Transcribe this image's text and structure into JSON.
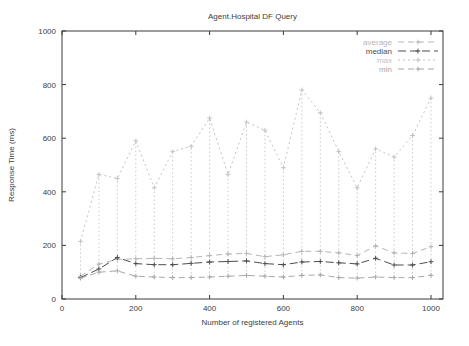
{
  "figure": {
    "title": "Agent.Hospital DF Query",
    "xlabel": "Number of registered Agents",
    "ylabel": "Response Time (ms)"
  },
  "chart_data": {
    "type": "line",
    "title": "Agent.Hospital DF Query",
    "xlabel": "Number of registered Agents",
    "ylabel": "Response Time (ms)",
    "xlim": [
      0,
      1040
    ],
    "ylim": [
      0,
      1000
    ],
    "xticks": [
      0,
      200,
      400,
      600,
      800,
      1000
    ],
    "yticks": [
      0,
      200,
      400,
      600,
      800,
      1000
    ],
    "grid": false,
    "legend_position": "top-right-inside",
    "legend_entries": [
      "average",
      "median",
      "max",
      "min"
    ],
    "x": [
      50,
      100,
      150,
      200,
      250,
      300,
      350,
      400,
      450,
      500,
      550,
      600,
      650,
      700,
      750,
      800,
      850,
      900,
      950,
      1000
    ],
    "series": [
      {
        "name": "average",
        "color": "#b5b5b5",
        "dash": "6 4",
        "marker": "plus",
        "values": [
          85,
          130,
          148,
          150,
          152,
          150,
          155,
          162,
          168,
          170,
          158,
          165,
          178,
          178,
          172,
          162,
          198,
          172,
          170,
          195
        ]
      },
      {
        "name": "median",
        "color": "#4d4d4d",
        "dash": "8 4",
        "marker": "plus",
        "values": [
          80,
          112,
          155,
          132,
          128,
          128,
          133,
          138,
          140,
          142,
          132,
          128,
          138,
          140,
          135,
          131,
          152,
          127,
          127,
          139
        ]
      },
      {
        "name": "max",
        "color": "#c3c3c3",
        "dash": "2 3",
        "marker": "plus",
        "values": [
          215,
          465,
          450,
          590,
          415,
          550,
          570,
          675,
          465,
          660,
          630,
          490,
          780,
          695,
          550,
          415,
          560,
          530,
          610,
          750
        ]
      },
      {
        "name": "min",
        "color": "#a8a8a8",
        "dash": "6 4",
        "marker": "plus",
        "values": [
          78,
          100,
          105,
          85,
          82,
          80,
          80,
          82,
          85,
          88,
          85,
          82,
          88,
          90,
          80,
          78,
          82,
          80,
          80,
          88
        ]
      }
    ],
    "range_bars": {
      "style": "vertical-dotted",
      "color": "#c9c9c9",
      "from": "min",
      "to": "max"
    }
  },
  "colors": {
    "background": "#ffffff",
    "border": "#3a3a3a",
    "tick_text": "#3d3d3d",
    "title_text": "#3d3d3d"
  }
}
